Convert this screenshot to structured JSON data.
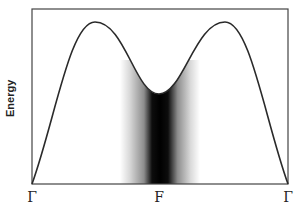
{
  "diagram": {
    "y_axis_label": "Energy",
    "x_ticks": [
      {
        "label": "Γ",
        "x": 32
      },
      {
        "label": "F",
        "x": 159
      },
      {
        "label": "Γ",
        "x": 288
      }
    ],
    "curve": {
      "description": "band dispersion curve with two maxima and a minimum at F",
      "color": "#2a2a2a"
    },
    "shaded_region": {
      "description": "grey gradient band centered at F, darkest at center",
      "color": "#000000"
    }
  }
}
